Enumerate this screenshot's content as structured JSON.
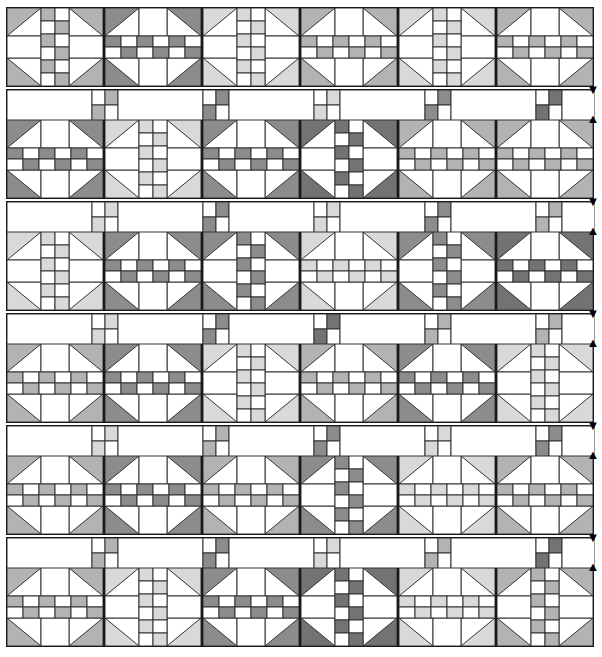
{
  "diagram": {
    "type": "quilt-assembly-diagram",
    "canvas": {
      "width": 602,
      "height": 657
    },
    "palette": {
      "background": "#ffffff",
      "outline": "#1a1a1a",
      "seam_line": "#333333",
      "fabric_white": "#ffffff",
      "fabric_light_gray": "#d9d9d9",
      "fabric_mid_gray": "#b3b3b3",
      "fabric_dark_gray": "#8c8c8c",
      "fabric_darkest_gray": "#737373"
    },
    "geometry": {
      "block_width": 96,
      "block_height": 78,
      "block_gap": 0,
      "sash_height": 30,
      "row_gap": 4,
      "left_margin": 6,
      "top_margin": 7,
      "block_inner_grid": "3x3 with half-square-triangle corners and pieced center bar",
      "sash_unit_width": 100,
      "sash_patch_size": 13
    },
    "counts": {
      "block_rows": 6,
      "blocks_per_row": 6,
      "sash_rows": 5,
      "sash_patches_per_row": 5,
      "total_blocks": 36,
      "arrow_pairs": 5
    },
    "legend": {
      "arrow_down": "▼",
      "arrow_up": "▲",
      "arrow_down_meaning": "press seam down",
      "arrow_up_meaning": "press seam up"
    },
    "block_rows": [
      {
        "row_index": 1,
        "y": 7,
        "blocks": [
          {
            "orientation": "vertical",
            "shade": "#b3b3b3",
            "center_shade": "#b3b3b3"
          },
          {
            "orientation": "horizontal",
            "shade": "#8c8c8c",
            "center_shade": "#8c8c8c"
          },
          {
            "orientation": "vertical",
            "shade": "#d9d9d9",
            "center_shade": "#d9d9d9"
          },
          {
            "orientation": "horizontal",
            "shade": "#b3b3b3",
            "center_shade": "#b3b3b3"
          },
          {
            "orientation": "vertical",
            "shade": "#d9d9d9",
            "center_shade": "#d9d9d9"
          },
          {
            "orientation": "horizontal",
            "shade": "#b3b3b3",
            "center_shade": "#b3b3b3"
          }
        ]
      },
      {
        "row_index": 2,
        "y": 119,
        "blocks": [
          {
            "orientation": "horizontal",
            "shade": "#8c8c8c",
            "center_shade": "#8c8c8c"
          },
          {
            "orientation": "vertical",
            "shade": "#d9d9d9",
            "center_shade": "#d9d9d9"
          },
          {
            "orientation": "horizontal",
            "shade": "#8c8c8c",
            "center_shade": "#8c8c8c"
          },
          {
            "orientation": "vertical",
            "shade": "#737373",
            "center_shade": "#737373"
          },
          {
            "orientation": "horizontal",
            "shade": "#b3b3b3",
            "center_shade": "#b3b3b3"
          },
          {
            "orientation": "horizontal",
            "shade": "#b3b3b3",
            "center_shade": "#b3b3b3"
          }
        ]
      },
      {
        "row_index": 3,
        "y": 231,
        "blocks": [
          {
            "orientation": "vertical",
            "shade": "#d9d9d9",
            "center_shade": "#d9d9d9"
          },
          {
            "orientation": "horizontal",
            "shade": "#8c8c8c",
            "center_shade": "#8c8c8c"
          },
          {
            "orientation": "vertical",
            "shade": "#8c8c8c",
            "center_shade": "#8c8c8c"
          },
          {
            "orientation": "horizontal",
            "shade": "#d9d9d9",
            "center_shade": "#d9d9d9"
          },
          {
            "orientation": "vertical",
            "shade": "#8c8c8c",
            "center_shade": "#8c8c8c"
          },
          {
            "orientation": "horizontal",
            "shade": "#737373",
            "center_shade": "#737373"
          }
        ]
      },
      {
        "row_index": 4,
        "y": 343,
        "blocks": [
          {
            "orientation": "horizontal",
            "shade": "#b3b3b3",
            "center_shade": "#b3b3b3"
          },
          {
            "orientation": "horizontal",
            "shade": "#8c8c8c",
            "center_shade": "#8c8c8c"
          },
          {
            "orientation": "vertical",
            "shade": "#d9d9d9",
            "center_shade": "#d9d9d9"
          },
          {
            "orientation": "horizontal",
            "shade": "#b3b3b3",
            "center_shade": "#b3b3b3"
          },
          {
            "orientation": "horizontal",
            "shade": "#8c8c8c",
            "center_shade": "#8c8c8c"
          },
          {
            "orientation": "vertical",
            "shade": "#d9d9d9",
            "center_shade": "#d9d9d9"
          }
        ]
      },
      {
        "row_index": 5,
        "y": 455,
        "blocks": [
          {
            "orientation": "horizontal",
            "shade": "#b3b3b3",
            "center_shade": "#b3b3b3"
          },
          {
            "orientation": "horizontal",
            "shade": "#8c8c8c",
            "center_shade": "#8c8c8c"
          },
          {
            "orientation": "horizontal",
            "shade": "#b3b3b3",
            "center_shade": "#b3b3b3"
          },
          {
            "orientation": "vertical",
            "shade": "#8c8c8c",
            "center_shade": "#8c8c8c"
          },
          {
            "orientation": "horizontal",
            "shade": "#d9d9d9",
            "center_shade": "#d9d9d9"
          },
          {
            "orientation": "horizontal",
            "shade": "#b3b3b3",
            "center_shade": "#b3b3b3"
          }
        ]
      },
      {
        "row_index": 6,
        "y": 567,
        "blocks": [
          {
            "orientation": "horizontal",
            "shade": "#b3b3b3",
            "center_shade": "#b3b3b3"
          },
          {
            "orientation": "vertical",
            "shade": "#d9d9d9",
            "center_shade": "#d9d9d9"
          },
          {
            "orientation": "horizontal",
            "shade": "#8c8c8c",
            "center_shade": "#8c8c8c"
          },
          {
            "orientation": "vertical",
            "shade": "#737373",
            "center_shade": "#737373"
          },
          {
            "orientation": "horizontal",
            "shade": "#d9d9d9",
            "center_shade": "#d9d9d9"
          },
          {
            "orientation": "vertical",
            "shade": "#b3b3b3",
            "center_shade": "#b3b3b3"
          }
        ]
      }
    ],
    "sash_rows": [
      {
        "row_index": 1,
        "y": 89,
        "patches": [
          {
            "shade": "#b3b3b3"
          },
          {
            "shade": "#8c8c8c"
          },
          {
            "shade": "#d9d9d9"
          },
          {
            "shade": "#8c8c8c"
          },
          {
            "shade": "#737373"
          }
        ]
      },
      {
        "row_index": 2,
        "y": 201,
        "patches": [
          {
            "shade": "#d9d9d9"
          },
          {
            "shade": "#8c8c8c"
          },
          {
            "shade": "#d9d9d9"
          },
          {
            "shade": "#8c8c8c"
          },
          {
            "shade": "#b3b3b3"
          }
        ]
      },
      {
        "row_index": 3,
        "y": 313,
        "patches": [
          {
            "shade": "#d9d9d9"
          },
          {
            "shade": "#8c8c8c"
          },
          {
            "shade": "#737373"
          },
          {
            "shade": "#b3b3b3"
          },
          {
            "shade": "#b3b3b3"
          }
        ]
      },
      {
        "row_index": 4,
        "y": 425,
        "patches": [
          {
            "shade": "#d9d9d9"
          },
          {
            "shade": "#b3b3b3"
          },
          {
            "shade": "#8c8c8c"
          },
          {
            "shade": "#d9d9d9"
          },
          {
            "shade": "#8c8c8c"
          }
        ]
      },
      {
        "row_index": 5,
        "y": 537,
        "patches": [
          {
            "shade": "#b3b3b3"
          },
          {
            "shade": "#8c8c8c"
          },
          {
            "shade": "#d9d9d9"
          },
          {
            "shade": "#b3b3b3"
          },
          {
            "shade": "#737373"
          }
        ]
      }
    ],
    "arrows": [
      {
        "pair_index": 1,
        "down_y": 84,
        "up_y": 113
      },
      {
        "pair_index": 2,
        "down_y": 196,
        "up_y": 225
      },
      {
        "pair_index": 3,
        "down_y": 308,
        "up_y": 337
      },
      {
        "pair_index": 4,
        "down_y": 420,
        "up_y": 449
      },
      {
        "pair_index": 5,
        "down_y": 532,
        "up_y": 561
      }
    ]
  }
}
